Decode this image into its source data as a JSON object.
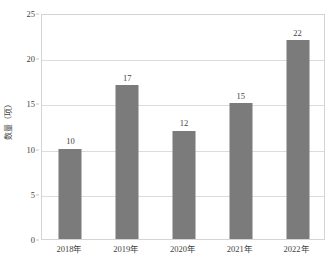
{
  "chart_data": {
    "type": "bar",
    "title": "",
    "subtitle": "",
    "xlabel": "",
    "ylabel": "数量（项）",
    "categories": [
      "2018年",
      "2019年",
      "2020年",
      "2021年",
      "2022年"
    ],
    "values": [
      10,
      17,
      12,
      15,
      22
    ],
    "value_labels": [
      "10",
      "17",
      "12",
      "15",
      "22"
    ],
    "ylim": [
      0,
      25
    ],
    "y_ticks": [
      0,
      5,
      10,
      15,
      20,
      25
    ],
    "y_tick_labels": [
      "0",
      "5",
      "10",
      "15",
      "20",
      "25"
    ],
    "grid": "horizontal",
    "legend": "none",
    "series": [
      {
        "name": "数量（项）",
        "values": [
          10,
          17,
          12,
          15,
          22
        ]
      }
    ],
    "colors": {
      "bar_fill": "#7b7b7b",
      "gridline": "#dcdcdc",
      "plot_border": "#d4d4d4",
      "text": "#3f3f3f",
      "background": "#ffffff"
    }
  }
}
